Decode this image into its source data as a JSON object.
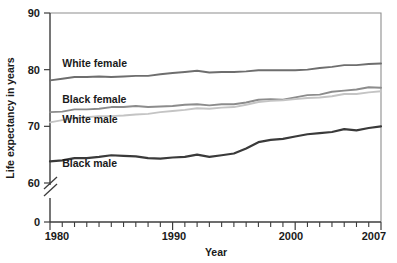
{
  "chart_data": {
    "type": "line",
    "title": "",
    "xlabel": "Year",
    "ylabel": "Life expectancy in years",
    "xlim": [
      1980,
      2007
    ],
    "ylim": [
      58,
      90
    ],
    "ytick_labels": [
      "0",
      "60",
      "70",
      "80",
      "90"
    ],
    "ytick_values": [
      0,
      60,
      70,
      80,
      90
    ],
    "xtick_labels": [
      "1980",
      "1990",
      "2000",
      "2007"
    ],
    "xtick_values": [
      1980,
      1990,
      2000,
      2007
    ],
    "axis_break": true,
    "axis_break_note": "y-axis broken between 0 and 60",
    "grid": false,
    "legend_position": "inline-labels",
    "x": [
      1980,
      1981,
      1982,
      1983,
      1984,
      1985,
      1986,
      1987,
      1988,
      1989,
      1990,
      1991,
      1992,
      1993,
      1994,
      1995,
      1996,
      1997,
      1998,
      1999,
      2000,
      2001,
      2002,
      2003,
      2004,
      2005,
      2006,
      2007
    ],
    "series": [
      {
        "name": "White female",
        "color": "#6e6e6e",
        "values": [
          78.1,
          78.4,
          78.7,
          78.7,
          78.8,
          78.7,
          78.8,
          78.9,
          78.9,
          79.2,
          79.4,
          79.6,
          79.8,
          79.5,
          79.6,
          79.6,
          79.7,
          79.9,
          79.9,
          79.9,
          79.9,
          80.0,
          80.3,
          80.5,
          80.8,
          80.8,
          81.0,
          81.1
        ]
      },
      {
        "name": "Black female",
        "color": "#8c8c8c",
        "values": [
          72.5,
          72.6,
          73.0,
          73.0,
          73.1,
          73.4,
          73.4,
          73.6,
          73.4,
          73.5,
          73.6,
          73.8,
          73.9,
          73.7,
          73.9,
          73.9,
          74.2,
          74.7,
          74.8,
          74.7,
          75.1,
          75.5,
          75.6,
          76.1,
          76.3,
          76.5,
          76.9,
          76.8
        ]
      },
      {
        "name": "White male",
        "color": "#c4c4c4",
        "values": [
          70.7,
          71.1,
          71.5,
          71.6,
          71.8,
          71.8,
          71.9,
          72.1,
          72.2,
          72.5,
          72.7,
          72.9,
          73.2,
          73.1,
          73.3,
          73.4,
          73.8,
          74.3,
          74.5,
          74.6,
          74.8,
          75.0,
          75.1,
          75.3,
          75.7,
          75.7,
          76.0,
          76.2
        ]
      },
      {
        "name": "Black male",
        "color": "#3a3a3a",
        "values": [
          63.8,
          64.0,
          64.4,
          64.4,
          64.6,
          64.9,
          64.8,
          64.7,
          64.4,
          64.3,
          64.5,
          64.6,
          65.0,
          64.6,
          64.9,
          65.2,
          66.1,
          67.2,
          67.6,
          67.8,
          68.2,
          68.6,
          68.8,
          69.0,
          69.5,
          69.3,
          69.7,
          70.0
        ]
      }
    ],
    "series_label_positions": [
      {
        "name": "White female",
        "x": 1981.0,
        "y": 80.4
      },
      {
        "name": "Black female",
        "x": 1981.0,
        "y": 74.2
      },
      {
        "name": "White male",
        "x": 1981.0,
        "y": 70.6
      },
      {
        "name": "Black male",
        "x": 1981.0,
        "y": 62.8
      }
    ]
  }
}
